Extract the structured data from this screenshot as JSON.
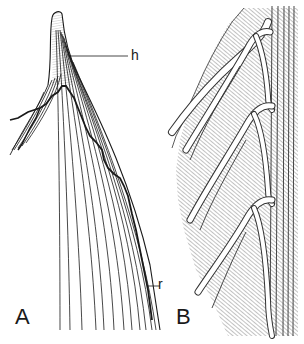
{
  "figure": {
    "panels": [
      {
        "id": "A",
        "label": "A",
        "description": "Tip of a structure with converging longitudinal lines (veins) and an irregular dark boundary line"
      },
      {
        "id": "B",
        "label": "B",
        "description": "Hatched section with curved white vein channels branching from a vertical bundle on the right"
      }
    ],
    "callouts": [
      {
        "id": "h",
        "label": "h"
      },
      {
        "id": "r",
        "label": "r"
      }
    ],
    "colors": {
      "ink": "#1a1a1a",
      "hatch": "#555555",
      "background": "#ffffff"
    }
  }
}
